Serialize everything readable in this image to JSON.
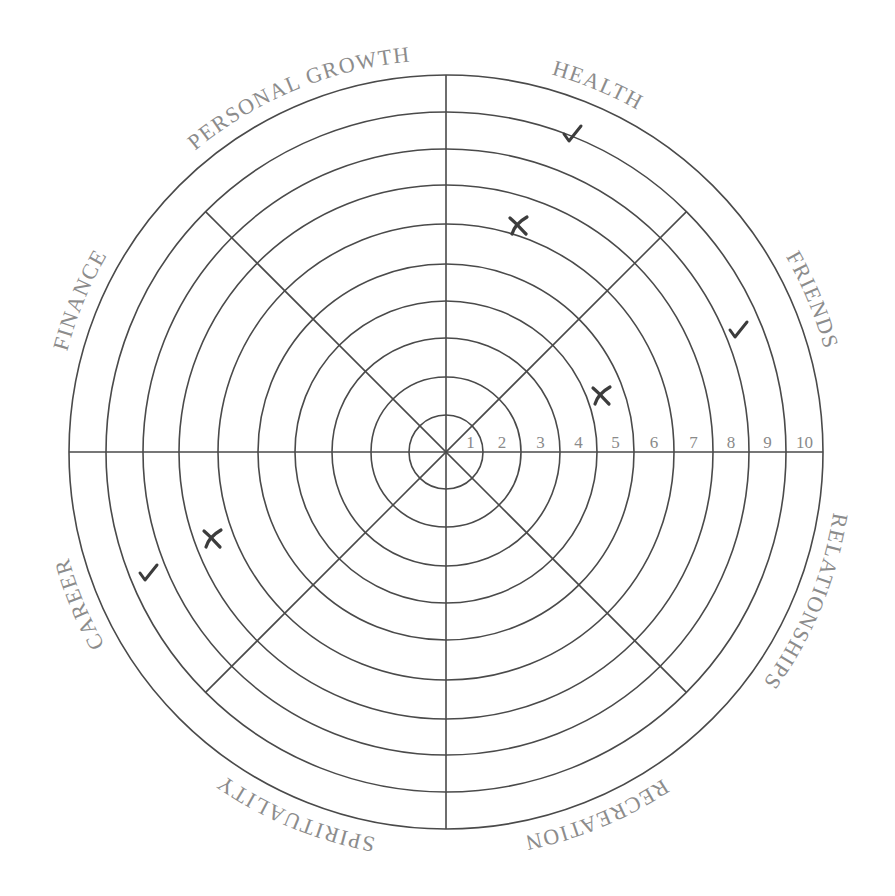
{
  "center": {
    "x": 446,
    "y": 452
  },
  "ring_radii": [
    37,
    75,
    114,
    151,
    188,
    228,
    267,
    303,
    340,
    377
  ],
  "ring_numbers": [
    "1",
    "2",
    "3",
    "4",
    "5",
    "6",
    "7",
    "8",
    "9",
    "10"
  ],
  "label_radius": 392,
  "categories": [
    {
      "label": "HEALTH",
      "center_angle": 22.5
    },
    {
      "label": "FRIENDS",
      "center_angle": 67.5
    },
    {
      "label": "RELATIONSHIPS",
      "center_angle": 112.5
    },
    {
      "label": "RECREATION",
      "center_angle": 157.5
    },
    {
      "label": "SPIRITUALITY",
      "center_angle": 202.5
    },
    {
      "label": "CAREER",
      "center_angle": 247.5
    },
    {
      "label": "FINANCE",
      "center_angle": 292.5
    },
    {
      "label": "PERSONAL GROWTH",
      "center_angle": 337.5
    }
  ],
  "marks": [
    {
      "category": "HEALTH",
      "type": "check",
      "x": 572,
      "y": 133,
      "ring": 9
    },
    {
      "category": "HEALTH",
      "type": "cross",
      "x": 518,
      "y": 225,
      "ring": 6
    },
    {
      "category": "FRIENDS",
      "type": "check",
      "x": 738,
      "y": 329,
      "ring": 9
    },
    {
      "category": "FRIENDS",
      "type": "cross",
      "x": 601,
      "y": 395,
      "ring": 5
    },
    {
      "category": "CAREER",
      "type": "check",
      "x": 148,
      "y": 572,
      "ring": 9
    },
    {
      "category": "CAREER",
      "type": "cross",
      "x": 212,
      "y": 538,
      "ring": 7
    }
  ],
  "colors": {
    "line": "#4a4a4a",
    "text": "#8c8c8c",
    "mark": "#3c3c3c",
    "background": "#ffffff"
  },
  "chart_data": {
    "type": "radial-wheel",
    "title": "",
    "scale": {
      "min": 1,
      "max": 10
    },
    "categories": [
      "HEALTH",
      "FRIENDS",
      "RELATIONSHIPS",
      "RECREATION",
      "SPIRITUALITY",
      "CAREER",
      "FINANCE",
      "PERSONAL GROWTH"
    ],
    "series": [
      {
        "name": "check (target)",
        "values": {
          "HEALTH": 9,
          "FRIENDS": 9,
          "CAREER": 9
        }
      },
      {
        "name": "cross (current)",
        "values": {
          "HEALTH": 6,
          "FRIENDS": 5,
          "CAREER": 7
        }
      }
    ]
  }
}
